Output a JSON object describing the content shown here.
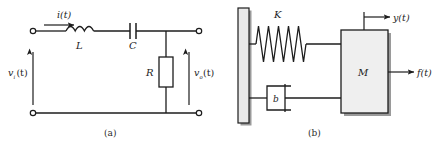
{
  "figure": {
    "panels": [
      {
        "id": "panel-a",
        "caption": "(a)",
        "type": "electrical-circuit",
        "description": "Series RLC circuit with voltage input and output across resistor",
        "labels": {
          "current": "i(t)",
          "inductor": "L",
          "capacitor": "C",
          "resistor": "R",
          "input_voltage": "v",
          "input_voltage_sub": "i",
          "input_voltage_tail": "(t)",
          "output_voltage": "v",
          "output_voltage_sub": "o",
          "output_voltage_tail": "(t)"
        }
      },
      {
        "id": "panel-b",
        "caption": "(b)",
        "type": "mechanical-system",
        "description": "Mass-spring-damper system attached to a fixed wall",
        "labels": {
          "spring": "K",
          "damper": "b",
          "mass": "M",
          "displacement": "y(t)",
          "force": "f(t)"
        }
      }
    ],
    "colors": {
      "line": "#1d1d1d",
      "fill_light": "#efefef",
      "shadow": "#9a9a9a",
      "background": "#ffffff"
    }
  }
}
